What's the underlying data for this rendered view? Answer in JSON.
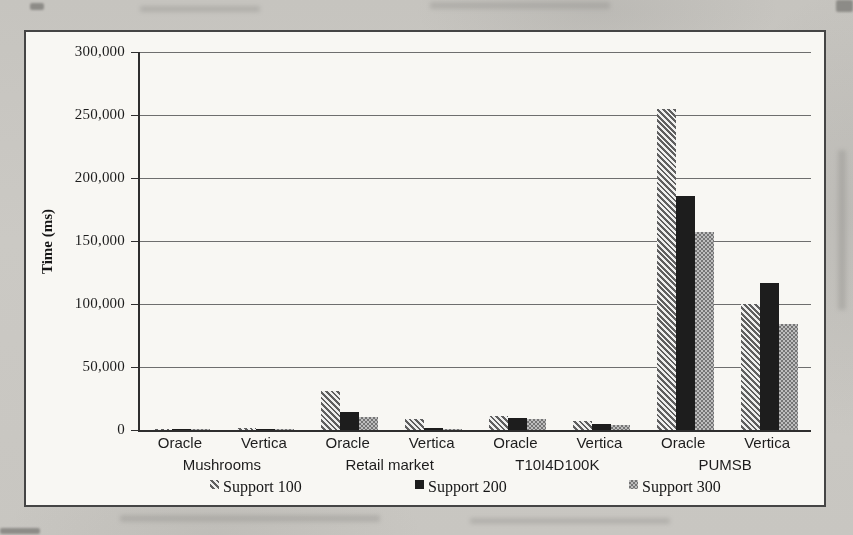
{
  "chart_data": {
    "type": "bar",
    "title": "",
    "xlabel": "",
    "ylabel": "Time (ms)",
    "ylim": [
      0,
      300000
    ],
    "ytick_interval": 50000,
    "ytick_labels": [
      "0",
      "50,000",
      "100,000",
      "150,000",
      "200,000",
      "250,000",
      "300,000"
    ],
    "grid": true,
    "legend_position": "bottom",
    "group_labels": [
      "Mushrooms",
      "Retail market",
      "T10I4D100K",
      "PUMSB"
    ],
    "x_labels": [
      "Oracle",
      "Vertica",
      "Oracle",
      "Vertica",
      "Oracle",
      "Vertica",
      "Oracle",
      "Vertica"
    ],
    "series": [
      {
        "name": "Support 100",
        "pattern": "diagonal-hatch",
        "values": [
          1200,
          1800,
          31000,
          9000,
          11000,
          7000,
          255000,
          100000
        ]
      },
      {
        "name": "Support 200",
        "pattern": "solid-black",
        "values": [
          800,
          1000,
          14000,
          1500,
          9500,
          5000,
          186000,
          117000
        ]
      },
      {
        "name": "Support 300",
        "pattern": "checker",
        "values": [
          500,
          600,
          10500,
          800,
          8500,
          4000,
          157000,
          84000
        ]
      }
    ],
    "colors": {
      "hatch_dark": "#5f5f5f",
      "solid": "#1d1d1d",
      "checker_gray": "#757575",
      "grid": "#6e6e6e",
      "frame_border": "#454545",
      "paper": "#f8f7f3",
      "photo_background": "#c9c7c2"
    }
  }
}
